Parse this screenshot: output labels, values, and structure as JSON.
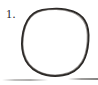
{
  "page": {
    "kind": "scanned-worksheet-fragment",
    "width": 98,
    "height": 85,
    "background_color": "#ffffff"
  },
  "item": {
    "number_label": "1.",
    "number_color": "#23211f"
  },
  "drawing": {
    "name": "hand-drawn-circle",
    "description": "freehand closed circle",
    "stroke_color": "#2b2826",
    "stroke_width": 1.9,
    "fill": "none",
    "bounds": {
      "left": 22,
      "top": 8,
      "right": 89,
      "bottom": 76
    },
    "path": "M 56.0 8.6 C 68.5 8.4 79.6 12.6 84.6 20.2 C 88.6 26.2 88.9 33.6 88.4 41.0 C 87.9 48.6 86.5 56.2 82.6 62.4 C 78.3 69.2 71.0 73.8 62.8 75.3 C 54.4 76.8 45.2 75.6 37.6 71.8 C 30.6 68.3 25.6 62.0 23.4 54.4 C 21.3 47.2 21.7 39.4 23.2 32.0 C 24.7 24.6 27.8 17.6 33.6 13.4 C 39.3 9.3 47.4 8.7 56.0 8.6 Z",
    "path_overlay": "M 55.2 9.4 C 67.4 9.2 78.2 13.2 83.3 20.6 C 87.2 26.4 87.7 33.8 87.2 41.2 C 86.7 48.8 85.3 56.0 81.5 62.0 C 77.2 68.6 70.2 73.0 62.2 74.4 C 54.0 75.9 45.2 74.7 37.9 71.0 C 31.1 67.6 26.4 61.4 24.3 54.0 C 22.3 47.0 22.7 39.4 24.1 32.2 C 25.6 25.0 28.6 18.2 34.2 14.2 C 39.7 10.2 46.9 9.5 55.2 9.4 Z"
  },
  "artifacts": {
    "bottom_smudge_label": "scan-edge-smudge",
    "smudge_color": "#6e6c6a"
  }
}
